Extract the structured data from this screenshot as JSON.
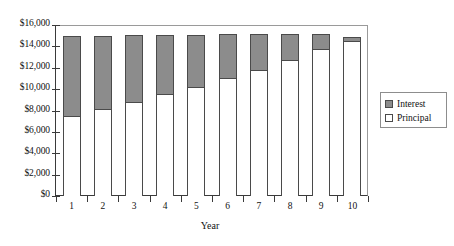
{
  "chart_data": {
    "type": "bar",
    "subtype": "stacked-column",
    "title": "",
    "xlabel": "Year",
    "ylabel": "",
    "categories": [
      "1",
      "2",
      "3",
      "4",
      "5",
      "6",
      "7",
      "8",
      "9",
      "10"
    ],
    "series": [
      {
        "name": "Principal",
        "color": "#ffffff",
        "values": [
          7500,
          8100,
          8800,
          9500,
          10200,
          11000,
          11800,
          12700,
          13800,
          14500
        ]
      },
      {
        "name": "Interest",
        "color": "#8c8c8c",
        "values": [
          7500,
          6900,
          6250,
          5600,
          4900,
          4150,
          3400,
          2500,
          1400,
          400
        ]
      }
    ],
    "totals": [
      15000,
      15000,
      15050,
      15100,
      15100,
      15150,
      15200,
      15200,
      15200,
      14900
    ],
    "ylim": [
      0,
      16000
    ],
    "ytick_values": [
      0,
      2000,
      4000,
      6000,
      8000,
      10000,
      12000,
      14000,
      16000
    ],
    "ytick_labels": [
      "$0",
      "$2,000",
      "$4,000",
      "$6,000",
      "$8,000",
      "$10,000",
      "$12,000",
      "$14,000",
      "$16,000"
    ],
    "grid": false,
    "legend_position": "right",
    "legend_entries": [
      {
        "label": "Interest",
        "swatch": "interest"
      },
      {
        "label": "Principal",
        "swatch": "principal"
      }
    ]
  }
}
